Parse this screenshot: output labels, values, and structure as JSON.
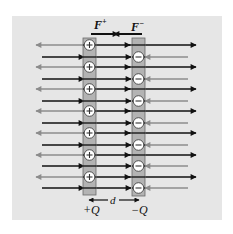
{
  "figure": {
    "panel": {
      "x": 12,
      "y": 16,
      "width": 210,
      "height": 204,
      "color": "#e6e6e6"
    },
    "colors": {
      "field_black": "#111111",
      "field_gray": "#8c8c8c",
      "plate_fill": "#a9a9a9",
      "plate_stroke": "#6a6a6a",
      "charge_fill": "#ffffff",
      "charge_stroke": "#444444"
    },
    "labels": {
      "force_positive": "F",
      "force_positive_sup": "+",
      "force_negative": "F",
      "force_negative_sup": "−",
      "separation": "d",
      "positive_plate": "+Q",
      "negative_plate": "−Q"
    },
    "positive_plate": {
      "x": 83,
      "y": 38,
      "width": 13,
      "height": 157,
      "charge_symbol": "+",
      "charge_count": 7
    },
    "negative_plate": {
      "x": 132,
      "y": 38,
      "width": 13,
      "height": 158,
      "charge_symbol": "−",
      "charge_count": 7
    },
    "row_set_a_y": [
      45,
      67,
      89,
      111,
      133,
      155,
      177
    ],
    "row_set_b_y": [
      57,
      79,
      101,
      123,
      145,
      166,
      188
    ],
    "legend_note": "Black arrows: net field lines; gray arrows: field of opposite plate",
    "force_arrows": {
      "y": 34,
      "positive": {
        "x1": 91,
        "x2": 117,
        "direction": "right"
      },
      "negative": {
        "x1": 142,
        "x2": 115,
        "direction": "left"
      }
    },
    "separation_arrow": {
      "y": 200,
      "x1": 89,
      "x2": 139
    }
  }
}
